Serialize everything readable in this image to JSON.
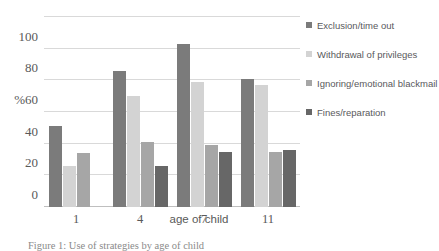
{
  "chart_data": {
    "type": "bar",
    "title": "",
    "xlabel": "age of child",
    "ylabel": "%",
    "categories": [
      "1",
      "4",
      "7",
      "11"
    ],
    "ylim": [
      0,
      120
    ],
    "yticks": [
      0,
      20,
      40,
      60,
      80,
      100,
      120
    ],
    "ytick_labels": [
      "0",
      "20",
      "%60",
      "40",
      "80",
      "100",
      ""
    ],
    "grid": true,
    "legend_position": "right",
    "series": [
      {
        "name": "Exclusion/time out",
        "color": "#7b7b7b",
        "values": [
          51,
          86,
          103,
          81
        ]
      },
      {
        "name": "Withdrawal of privileges",
        "color": "#d3d3d3",
        "values": [
          26,
          70,
          79,
          77
        ]
      },
      {
        "name": "Ignoring/emotional blackmail",
        "color": "#a6a6a6",
        "values": [
          34,
          41,
          39,
          35
        ]
      },
      {
        "name": "Fines/reparation",
        "color": "#676767",
        "values": [
          null,
          26,
          35,
          36
        ]
      }
    ]
  },
  "axis": {
    "y_labels": [
      {
        "value": 100,
        "text": "100"
      },
      {
        "value": 80,
        "text": "80"
      },
      {
        "value": 60,
        "text": "%60"
      },
      {
        "value": 40,
        "text": "40"
      },
      {
        "value": 20,
        "text": "20"
      },
      {
        "value": 0,
        "text": "0"
      }
    ],
    "x_title": "age of child",
    "x_labels": [
      "1",
      "4",
      "7",
      "11"
    ]
  },
  "legend": {
    "items": [
      {
        "label": "Exclusion/time out",
        "color": "#7b7b7b"
      },
      {
        "label": "Withdrawal of privileges",
        "color": "#d3d3d3"
      },
      {
        "label": "Ignoring/emotional blackmail",
        "color": "#a6a6a6"
      },
      {
        "label": "Fines/reparation",
        "color": "#676767"
      }
    ]
  },
  "caption": {
    "text": "Figure 1: Use of strategies by age of child"
  }
}
